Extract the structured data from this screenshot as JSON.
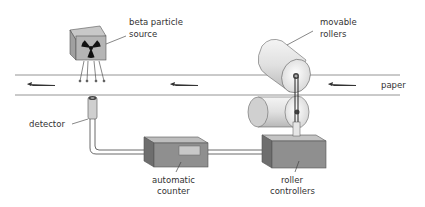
{
  "diagram": {
    "labels": {
      "source_line1": "beta particle",
      "source_line2": "source",
      "rollers_line1": "movable",
      "rollers_line2": "rollers",
      "paper": "paper",
      "detector": "detector",
      "counter_line1": "automatic",
      "counter_line2": "counter",
      "controllers_line1": "roller",
      "controllers_line2": "controllers"
    },
    "icons": {
      "source": "radiation-trefoil",
      "flow_direction": "arrow-left"
    },
    "colors": {
      "box_front": "#8f8f8f",
      "box_top": "#c4c4c4",
      "box_side": "#6e6e6e",
      "roller": "#e8e8e8",
      "lines": "#555555",
      "text": "#333333",
      "display": "#c8c8c8"
    }
  }
}
